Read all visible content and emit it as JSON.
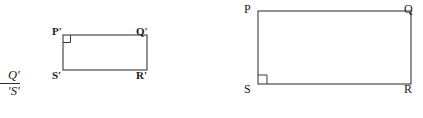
{
  "figure": {
    "type": "geometry-diagram",
    "stroke_color": "#3a3a3a",
    "background_color": "#ffffff",
    "ratio_fragment": {
      "numerator": "Q'",
      "denominator": "'S'",
      "note": "cropped at left image edge"
    },
    "shapes": [
      {
        "name": "small-rectangle",
        "vertices": [
          {
            "key": "top_left",
            "label": "P'",
            "x": 63,
            "y": 35
          },
          {
            "key": "top_right",
            "label": "Q'",
            "x": 147,
            "y": 35
          },
          {
            "key": "bottom_right",
            "label": "R'",
            "x": 147,
            "y": 70
          },
          {
            "key": "bottom_left",
            "label": "S'",
            "x": 63,
            "y": 70
          }
        ],
        "right_angle_at": "top_left",
        "width": 84,
        "height": 35
      },
      {
        "name": "large-rectangle",
        "vertices": [
          {
            "key": "top_left",
            "label": "P",
            "x": 258,
            "y": 11
          },
          {
            "key": "top_right",
            "label": "Q",
            "x": 411,
            "y": 11
          },
          {
            "key": "bottom_right",
            "label": "R",
            "x": 411,
            "y": 84
          },
          {
            "key": "bottom_left",
            "label": "S",
            "x": 258,
            "y": 84
          }
        ],
        "right_angle_at": "bottom_left",
        "width": 153,
        "height": 73
      }
    ]
  }
}
